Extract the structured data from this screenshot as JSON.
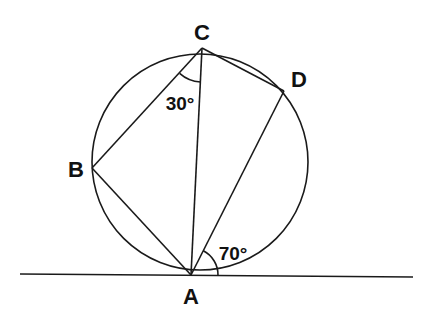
{
  "diagram": {
    "points": {
      "A": {
        "label": "A",
        "x": 191,
        "y": 275
      },
      "B": {
        "label": "B",
        "x": 92,
        "y": 168
      },
      "C": {
        "label": "C",
        "x": 202,
        "y": 48
      },
      "D": {
        "label": "D",
        "x": 284,
        "y": 91
      }
    },
    "circle": {
      "cx": 200,
      "cy": 162,
      "r": 108
    },
    "tangent": {
      "x1": 20,
      "y1": 274,
      "x2": 413,
      "y2": 277
    },
    "angles": {
      "BCA": {
        "label": "30°"
      },
      "DA_tangent": {
        "label": "70°"
      }
    },
    "stroke_color": "#1a1a1a"
  }
}
